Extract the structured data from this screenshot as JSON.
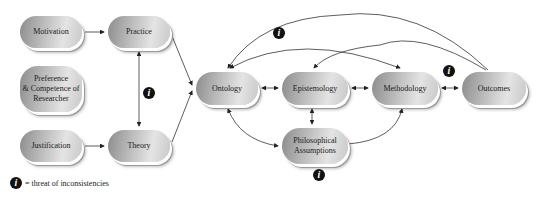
{
  "nodes": {
    "motivation": {
      "label": "Motivation"
    },
    "practice": {
      "label": "Practice"
    },
    "preference": {
      "label": "Preference\n& Competence of\nResearcher"
    },
    "justification": {
      "label": "Justification"
    },
    "theory": {
      "label": "Theory"
    },
    "ontology": {
      "label": "Ontology"
    },
    "epistemology": {
      "label": "Epistemology"
    },
    "methodology": {
      "label": "Methodology"
    },
    "outcomes": {
      "label": "Outcomes"
    },
    "philosophical": {
      "label": "Philosophical\nAssumptions"
    }
  },
  "edges": [
    {
      "from": "Motivation",
      "to": "Practice",
      "type": "arrow"
    },
    {
      "from": "Justification",
      "to": "Theory",
      "type": "arrow"
    },
    {
      "from": "Practice",
      "to": "Theory",
      "type": "bidirectional"
    },
    {
      "from": "Practice",
      "to": "Ontology",
      "type": "arrow"
    },
    {
      "from": "Theory",
      "to": "Ontology",
      "type": "arrow"
    },
    {
      "from": "Ontology",
      "to": "Epistemology",
      "type": "bidirectional"
    },
    {
      "from": "Epistemology",
      "to": "Methodology",
      "type": "bidirectional"
    },
    {
      "from": "Methodology",
      "to": "Outcomes",
      "type": "bidirectional"
    },
    {
      "from": "Epistemology",
      "to": "Philosophical Assumptions",
      "type": "bidirectional"
    },
    {
      "from": "Ontology",
      "to": "Philosophical Assumptions",
      "type": "bidirectional"
    },
    {
      "from": "Philosophical Assumptions",
      "to": "Methodology",
      "type": "arrow"
    },
    {
      "from": "Outcomes",
      "to": "Ontology",
      "type": "arrow-arc"
    },
    {
      "from": "Outcomes",
      "to": "Epistemology",
      "type": "arrow-arc"
    },
    {
      "from": "Ontology",
      "to": "Methodology",
      "type": "bidirectional-arc"
    }
  ],
  "info_icon": {
    "glyph": "i"
  },
  "legend": {
    "text": "= threat of inconsistencies"
  }
}
